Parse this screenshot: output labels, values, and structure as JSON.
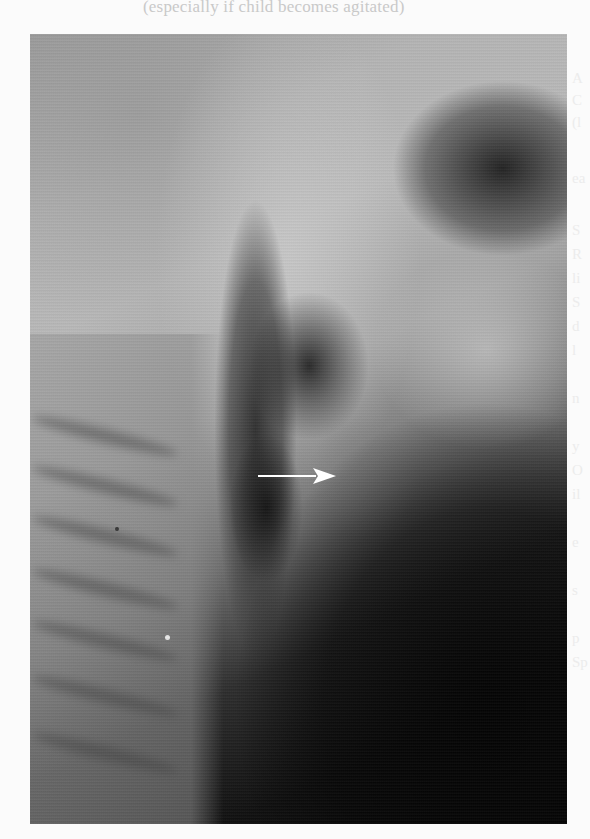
{
  "page": {
    "top_caption": "(especially if child becomes agitated)",
    "right_bleed_text": [
      "A",
      "C",
      "(l",
      "ea",
      "S",
      "R",
      "li",
      "S",
      "d",
      "l",
      "n",
      "y",
      "O",
      "il",
      "e",
      "s",
      "p",
      "Sp"
    ]
  },
  "figure": {
    "type": "radiograph",
    "view": "lateral neck x-ray",
    "annotation": {
      "type": "arrow",
      "direction": "right",
      "color": "#ffffff"
    },
    "colors": {
      "bright": "#c8c8c8",
      "mid": "#8a8a8a",
      "dark": "#050505",
      "page": "#fbfbfb"
    }
  }
}
